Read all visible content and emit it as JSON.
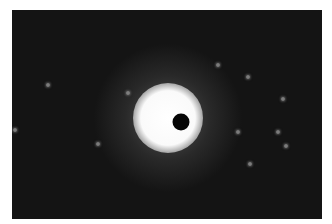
{
  "image": {
    "description": "Diffraction pattern: dark field with bright central beam and scattered faint spots",
    "frame": {
      "x": 12,
      "y": 10,
      "width": 310,
      "height": 209,
      "color": "#141414"
    },
    "central_beam": {
      "x": 168,
      "y": 118
    },
    "beam_stop": {
      "x": 181,
      "y": 122,
      "radius": 8,
      "color": "#050505"
    },
    "spots": [
      {
        "x": 218,
        "y": 65
      },
      {
        "x": 248,
        "y": 77
      },
      {
        "x": 283,
        "y": 99
      },
      {
        "x": 238,
        "y": 132
      },
      {
        "x": 278,
        "y": 132
      },
      {
        "x": 286,
        "y": 146
      },
      {
        "x": 250,
        "y": 164
      },
      {
        "x": 48,
        "y": 85
      },
      {
        "x": 128,
        "y": 93
      },
      {
        "x": 15,
        "y": 130
      },
      {
        "x": 98,
        "y": 144
      }
    ]
  }
}
